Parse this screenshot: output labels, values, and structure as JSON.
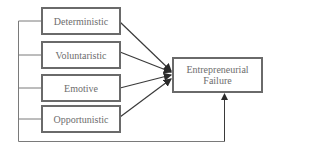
{
  "diagram": {
    "type": "flow",
    "factors": [
      {
        "id": "deterministic",
        "label": "Deterministic"
      },
      {
        "id": "voluntaristic",
        "label": "Voluntaristic"
      },
      {
        "id": "emotive",
        "label": "Emotive"
      },
      {
        "id": "opportunistic",
        "label": "Opportunistic"
      }
    ],
    "outcome": {
      "id": "entrepreneurial-failure",
      "label": "Entrepreneurial Failure"
    },
    "edges": [
      {
        "from": "deterministic",
        "to": "entrepreneurial-failure"
      },
      {
        "from": "voluntaristic",
        "to": "entrepreneurial-failure"
      },
      {
        "from": "emotive",
        "to": "entrepreneurial-failure"
      },
      {
        "from": "opportunistic",
        "to": "entrepreneurial-failure"
      },
      {
        "from": "all-factors-combined",
        "to": "entrepreneurial-failure",
        "route": "bracket-bottom"
      }
    ],
    "colors": {
      "line": "#3a3a3a",
      "box_border": "#6a6a6a",
      "text": "#6d6d6d"
    }
  }
}
